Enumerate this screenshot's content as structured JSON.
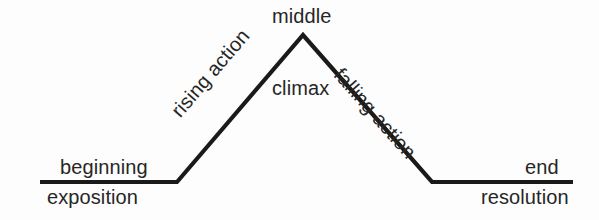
{
  "diagram": {
    "background_color": "#fdfdfd",
    "line_color": "#1a1a1a",
    "text_color": "#262626",
    "line_width": 4.2
  },
  "labels": {
    "middle": "middle",
    "climax": "climax",
    "rising_action": "rising action",
    "falling_action": "falling action",
    "beginning": "beginning",
    "exposition": "exposition",
    "end": "end",
    "resolution": "resolution"
  },
  "chart_data": {
    "type": "line",
    "title": "",
    "xlabel": "",
    "ylabel": "",
    "grid": false,
    "legend": "none",
    "xlim": [
      0,
      599
    ],
    "ylim": [
      220,
      0
    ],
    "series": [
      {
        "name": "plot-arc",
        "points": [
          [
            40,
            182
          ],
          [
            177,
            182
          ],
          [
            303,
            35
          ],
          [
            432,
            182
          ],
          [
            573,
            182
          ]
        ]
      }
    ],
    "annotations": [
      {
        "text": "middle",
        "x": 303,
        "y": 16,
        "rotation": 0,
        "position": "above-apex"
      },
      {
        "text": "climax",
        "x": 300,
        "y": 88,
        "rotation": 0,
        "position": "below-apex"
      },
      {
        "text": "rising action",
        "x": 220,
        "y": 120,
        "rotation": -49.4,
        "position": "along-rising-slope"
      },
      {
        "text": "falling action",
        "x": 383,
        "y": 113,
        "rotation": 48.7,
        "position": "along-falling-slope"
      },
      {
        "text": "beginning",
        "x": 105,
        "y": 167,
        "rotation": 0,
        "position": "above-left-baseline"
      },
      {
        "text": "exposition",
        "x": 103,
        "y": 197,
        "rotation": 0,
        "position": "below-left-baseline"
      },
      {
        "text": "end",
        "x": 545,
        "y": 167,
        "rotation": 0,
        "position": "above-right-baseline"
      },
      {
        "text": "resolution",
        "x": 527,
        "y": 197,
        "rotation": 0,
        "position": "below-right-baseline"
      }
    ],
    "segments": [
      {
        "name": "exposition-baseline",
        "from": [
          40,
          182
        ],
        "to": [
          177,
          182
        ]
      },
      {
        "name": "rising-action",
        "from": [
          177,
          182
        ],
        "to": [
          303,
          35
        ]
      },
      {
        "name": "falling-action",
        "from": [
          303,
          35
        ],
        "to": [
          432,
          182
        ]
      },
      {
        "name": "resolution-baseline",
        "from": [
          432,
          182
        ],
        "to": [
          573,
          182
        ]
      }
    ]
  }
}
